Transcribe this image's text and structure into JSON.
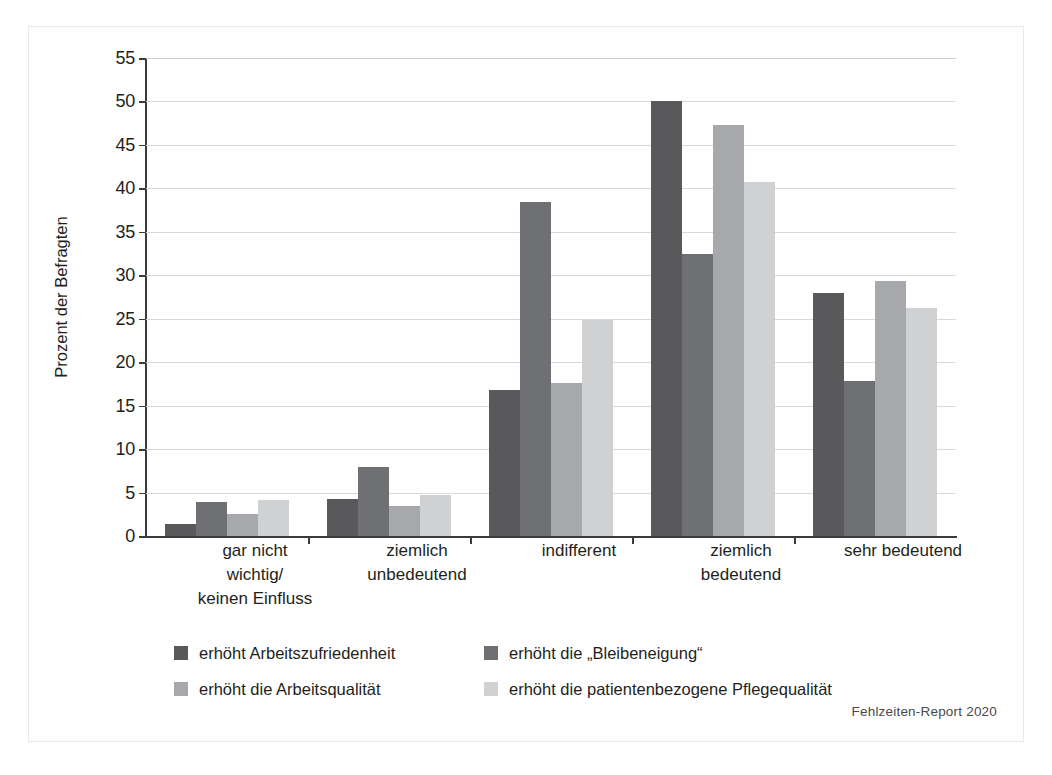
{
  "figure": {
    "footer": "Fehlzeiten-Report 2020",
    "background": "#ffffff",
    "border_color": "#e9e9e9"
  },
  "chart_data": {
    "type": "bar",
    "title": "",
    "subtitle": "",
    "xlabel": "",
    "ylabel": "Prozent der Befragten",
    "ylim": [
      0,
      55
    ],
    "yticks": [
      0,
      5,
      10,
      15,
      20,
      25,
      30,
      35,
      40,
      45,
      50,
      55
    ],
    "grid": true,
    "legend_position": "bottom",
    "categories": [
      "gar nicht\nwichtig/\nkeinen Einfluss",
      "ziemlich\nunbedeutend",
      "indifferent",
      "ziemlich\nbedeutend",
      "sehr bedeutend"
    ],
    "series": [
      {
        "name": "erhöht Arbeitszufriedenheit",
        "color": "#59595b",
        "values": [
          1.4,
          4.3,
          16.8,
          50.0,
          28.0
        ]
      },
      {
        "name": "erhöht die „Bleibeneigung“",
        "color": "#6f7073",
        "values": [
          3.9,
          7.9,
          38.4,
          32.5,
          17.8
        ]
      },
      {
        "name": "erhöht die Arbeitsqualität",
        "color": "#a6a8ab",
        "values": [
          2.5,
          3.4,
          17.6,
          47.3,
          29.4
        ]
      },
      {
        "name": "erhöht die patientenbezogene Pflegequalität",
        "color": "#cfd1d2",
        "values": [
          4.1,
          4.7,
          24.8,
          40.7,
          26.2
        ]
      }
    ]
  }
}
